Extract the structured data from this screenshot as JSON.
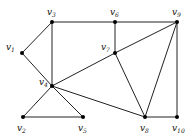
{
  "graph": {
    "nodes": [
      {
        "id": "v1",
        "label": "v",
        "sub": "1",
        "x": 22,
        "y": 53,
        "lx": 6,
        "ly": 50
      },
      {
        "id": "v2",
        "label": "v",
        "sub": "2",
        "x": 23,
        "y": 117,
        "lx": 17,
        "ly": 131
      },
      {
        "id": "v3",
        "label": "v",
        "sub": "3",
        "x": 52,
        "y": 22,
        "lx": 47,
        "ly": 15
      },
      {
        "id": "v4",
        "label": "v",
        "sub": "4",
        "x": 52,
        "y": 86,
        "lx": 39,
        "ly": 85
      },
      {
        "id": "v5",
        "label": "v",
        "sub": "5",
        "x": 83,
        "y": 117,
        "lx": 78,
        "ly": 131
      },
      {
        "id": "v6",
        "label": "v",
        "sub": "6",
        "x": 115,
        "y": 22,
        "lx": 110,
        "ly": 15
      },
      {
        "id": "v7",
        "label": "v",
        "sub": "7",
        "x": 115,
        "y": 53,
        "lx": 101,
        "ly": 50
      },
      {
        "id": "v8",
        "label": "v",
        "sub": "8",
        "x": 145,
        "y": 117,
        "lx": 140,
        "ly": 131
      },
      {
        "id": "v9",
        "label": "v",
        "sub": "9",
        "x": 177,
        "y": 22,
        "lx": 172,
        "ly": 15
      },
      {
        "id": "v10",
        "label": "v",
        "sub": "10",
        "x": 177,
        "y": 117,
        "lx": 172,
        "ly": 131
      }
    ],
    "edges": [
      [
        "v1",
        "v3"
      ],
      [
        "v1",
        "v4"
      ],
      [
        "v3",
        "v6"
      ],
      [
        "v6",
        "v9"
      ],
      [
        "v3",
        "v4"
      ],
      [
        "v6",
        "v7"
      ],
      [
        "v4",
        "v7"
      ],
      [
        "v7",
        "v9"
      ],
      [
        "v4",
        "v2"
      ],
      [
        "v4",
        "v5"
      ],
      [
        "v2",
        "v5"
      ],
      [
        "v4",
        "v8"
      ],
      [
        "v7",
        "v8"
      ],
      [
        "v9",
        "v8"
      ],
      [
        "v9",
        "v10"
      ],
      [
        "v8",
        "v10"
      ]
    ]
  }
}
